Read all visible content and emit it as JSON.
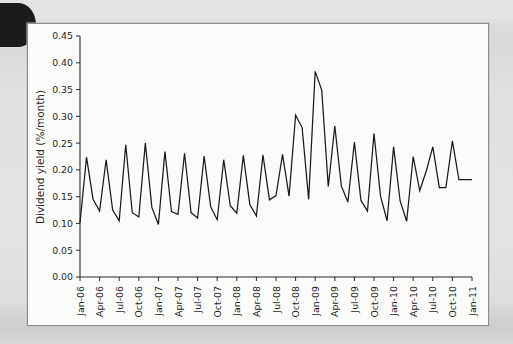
{
  "figure": {
    "kind": "line-chart-figure",
    "background_color": "#dededc",
    "panel_color": "#fbfbfa",
    "frame_color": "#8d8d8b",
    "line_color": "#1a1a1a"
  },
  "chart_data": {
    "type": "line",
    "title": "",
    "subtitle": "",
    "xlabel": "",
    "ylabel": "Dividend yield (%/month)",
    "ylim": [
      0.0,
      0.45
    ],
    "ytick_labels": [
      "0.00",
      "0.05",
      "0.10",
      "0.15",
      "0.20",
      "0.25",
      "0.30",
      "0.35",
      "0.40",
      "0.45"
    ],
    "ytick_values": [
      0.0,
      0.05,
      0.1,
      0.15,
      0.2,
      0.25,
      0.3,
      0.35,
      0.4,
      0.45
    ],
    "xtick_labels": [
      "Jan-06",
      "Apr-06",
      "Jul-06",
      "Oct-06",
      "Jan-07",
      "Apr-07",
      "Jul-07",
      "Oct-07",
      "Jan-08",
      "Apr-08",
      "Jul-08",
      "Oct-08",
      "Jan-09",
      "Apr-09",
      "Jul-09",
      "Oct-09",
      "Jan-10",
      "Apr-10",
      "Jul-10",
      "Oct-10",
      "Jan-11"
    ],
    "xtick_interval_months": 3,
    "grid": false,
    "legend": null,
    "legend_position": "none",
    "x_start": "Jan-06",
    "x_end": "Jan-11",
    "x": [
      "Jan-06",
      "Feb-06",
      "Mar-06",
      "Apr-06",
      "May-06",
      "Jun-06",
      "Jul-06",
      "Aug-06",
      "Sep-06",
      "Oct-06",
      "Nov-06",
      "Dec-06",
      "Jan-07",
      "Feb-07",
      "Mar-07",
      "Apr-07",
      "May-07",
      "Jun-07",
      "Jul-07",
      "Aug-07",
      "Sep-07",
      "Oct-07",
      "Nov-07",
      "Dec-07",
      "Jan-08",
      "Feb-08",
      "Mar-08",
      "Apr-08",
      "May-08",
      "Jun-08",
      "Jul-08",
      "Aug-08",
      "Sep-08",
      "Oct-08",
      "Nov-08",
      "Dec-08",
      "Jan-09",
      "Feb-09",
      "Mar-09",
      "Apr-09",
      "May-09",
      "Jun-09",
      "Jul-09",
      "Aug-09",
      "Sep-09",
      "Oct-09",
      "Nov-09",
      "Dec-09",
      "Jan-10",
      "Feb-10",
      "Mar-10",
      "Apr-10",
      "May-10",
      "Jun-10",
      "Jul-10",
      "Aug-10",
      "Sep-10",
      "Oct-10",
      "Nov-10",
      "Dec-10",
      "Jan-11"
    ],
    "values": [
      0.101,
      0.224,
      0.145,
      0.123,
      0.219,
      0.125,
      0.105,
      0.247,
      0.12,
      0.112,
      0.25,
      0.13,
      0.098,
      0.234,
      0.122,
      0.117,
      0.231,
      0.12,
      0.11,
      0.226,
      0.131,
      0.107,
      0.219,
      0.133,
      0.119,
      0.227,
      0.135,
      0.114,
      0.228,
      0.144,
      0.152,
      0.229,
      0.151,
      0.302,
      0.279,
      0.145,
      0.384,
      0.349,
      0.169,
      0.282,
      0.17,
      0.14,
      0.252,
      0.143,
      0.123,
      0.268,
      0.151,
      0.105,
      0.243,
      0.142,
      0.104,
      0.225,
      0.161,
      0.198,
      0.243,
      0.167,
      0.167,
      0.254,
      0.182,
      0.182,
      0.182
    ],
    "series": [
      {
        "name": "Dividend yield",
        "color": "#1a1a1a",
        "values": [
          0.101,
          0.224,
          0.145,
          0.123,
          0.219,
          0.125,
          0.105,
          0.247,
          0.12,
          0.112,
          0.25,
          0.13,
          0.098,
          0.234,
          0.122,
          0.117,
          0.231,
          0.12,
          0.11,
          0.226,
          0.131,
          0.107,
          0.219,
          0.133,
          0.119,
          0.227,
          0.135,
          0.114,
          0.228,
          0.144,
          0.152,
          0.229,
          0.151,
          0.302,
          0.279,
          0.145,
          0.384,
          0.349,
          0.169,
          0.282,
          0.17,
          0.14,
          0.252,
          0.143,
          0.123,
          0.268,
          0.151,
          0.105,
          0.243,
          0.142,
          0.104,
          0.225,
          0.161,
          0.198,
          0.243,
          0.167,
          0.167,
          0.254,
          0.182,
          0.182,
          0.182
        ]
      }
    ],
    "annotations": [],
    "max_value": 0.384,
    "max_label": "Feb-09",
    "min_value": 0.098,
    "min_label": "Jan-07"
  }
}
